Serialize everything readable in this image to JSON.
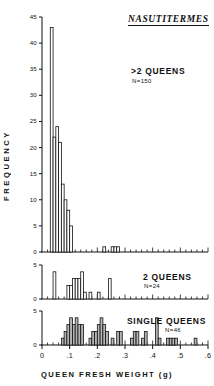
{
  "figure": {
    "title": "NASUTITERMES",
    "x_axis_label": "QUEEN FRESH WEIGHT (g)",
    "y_axis_label": "FREQUENCY"
  },
  "panels": [
    {
      "id": "more-than-two-queens",
      "annotation": ">2  QUEENS",
      "sample_size_label": "N=150",
      "y_ticks": [
        "0",
        "5",
        "10",
        "15",
        "20",
        "25",
        "30",
        "35",
        "40",
        "45"
      ]
    },
    {
      "id": "two-queens",
      "annotation": "2  QUEENS",
      "sample_size_label": "N=24",
      "y_ticks": [
        "0",
        "5"
      ]
    },
    {
      "id": "single-queens",
      "annotation": "SINGLE  QUEENS",
      "sample_size_label": "N=46",
      "y_ticks": [
        "0",
        "5"
      ]
    }
  ],
  "x_ticks": [
    "0",
    ".1",
    ".2",
    ".3",
    ".4",
    ".5",
    ".6"
  ],
  "chart_data": [
    {
      "type": "bar",
      "title": "NASUTITERMES",
      "subtitle": ">2  QUEENS",
      "annotation": "N=150",
      "xlabel": "QUEEN FRESH WEIGHT (g)",
      "ylabel": "FREQUENCY",
      "xlim": [
        0,
        0.6
      ],
      "ylim": [
        0,
        45
      ],
      "bin_width": 0.01,
      "grid": false,
      "x": [
        0.035,
        0.045,
        0.055,
        0.065,
        0.075,
        0.085,
        0.095,
        0.105,
        0.225,
        0.255,
        0.265,
        0.275
      ],
      "values": [
        43,
        22,
        24,
        21,
        13,
        10,
        8,
        5,
        1,
        1,
        1,
        1
      ],
      "yticks": [
        0,
        5,
        10,
        15,
        20,
        25,
        30,
        35,
        40,
        45
      ],
      "xticks": [
        0,
        0.1,
        0.2,
        0.3,
        0.4,
        0.5,
        0.6
      ],
      "xticklabels": [
        "0",
        ".1",
        ".2",
        ".3",
        ".4",
        ".5",
        ".6"
      ]
    },
    {
      "type": "bar",
      "subtitle": "2  QUEENS",
      "annotation": "N=24",
      "xlim": [
        0,
        0.6
      ],
      "ylim": [
        0,
        5
      ],
      "bin_width": 0.01,
      "grid": false,
      "x": [
        0.045,
        0.095,
        0.105,
        0.115,
        0.125,
        0.135,
        0.145,
        0.155,
        0.175,
        0.205,
        0.245
      ],
      "values": [
        4,
        2,
        2,
        3,
        3,
        3,
        4,
        1,
        1,
        1,
        3
      ],
      "yticks": [
        0,
        5
      ],
      "fill": "white"
    },
    {
      "type": "bar",
      "subtitle": "SINGLE  QUEENS",
      "annotation": "N=46",
      "xlim": [
        0,
        0.6
      ],
      "ylim": [
        0,
        5
      ],
      "bin_width": 0.01,
      "grid": false,
      "x": [
        0.075,
        0.085,
        0.095,
        0.105,
        0.115,
        0.125,
        0.135,
        0.145,
        0.175,
        0.185,
        0.195,
        0.205,
        0.215,
        0.225,
        0.235,
        0.255,
        0.275,
        0.285,
        0.325,
        0.335,
        0.345,
        0.365,
        0.375,
        0.415,
        0.425,
        0.455,
        0.465,
        0.475,
        0.485,
        0.555
      ],
      "values": [
        1,
        2,
        3,
        4,
        3,
        4,
        3,
        3,
        1,
        2,
        2,
        3,
        4,
        3,
        2,
        1,
        2,
        2,
        1,
        2,
        2,
        1,
        2,
        4,
        1,
        1,
        1,
        1,
        1,
        1
      ],
      "yticks": [
        0,
        5
      ],
      "fill": "#b5b5b5"
    }
  ],
  "colors": {
    "axis": "#111111",
    "bar_outline": "#111111",
    "bar_fill_open": "#ffffff",
    "bar_fill_shaded": "#b5b5b5",
    "background": "#ffffff"
  }
}
